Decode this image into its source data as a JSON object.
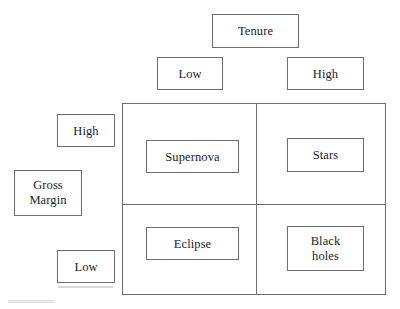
{
  "diagram": {
    "type": "2x2-matrix",
    "x_axis": {
      "title": "Tenure",
      "low_label": "Low",
      "high_label": "High"
    },
    "y_axis": {
      "title": "Gross\nMargin",
      "title_line1": "Gross",
      "title_line2": "Margin",
      "high_label": "High",
      "low_label": "Low"
    },
    "quadrants": [
      {
        "id": "supernova",
        "label": "Supernova",
        "tenure": "Low",
        "gross_margin": "High"
      },
      {
        "id": "stars",
        "label": "Stars",
        "tenure": "High",
        "gross_margin": "High"
      },
      {
        "id": "eclipse",
        "label": "Eclipse",
        "tenure": "Low",
        "gross_margin": "Low"
      },
      {
        "id": "black-holes",
        "label_line1": "Black",
        "label_line2": "holes",
        "label": "Black holes",
        "tenure": "High",
        "gross_margin": "Low"
      }
    ],
    "colors": {
      "background": "#ffffff",
      "border": "#6e6e6e",
      "text": "#1d1d1d"
    }
  }
}
